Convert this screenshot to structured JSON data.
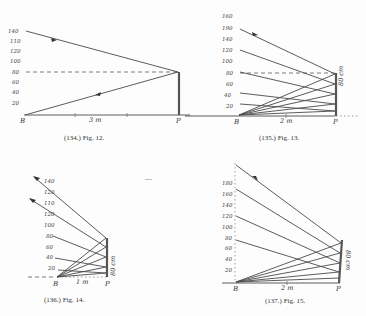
{
  "figures": [
    {
      "id": "fig12",
      "caption": "(134.)  Fig. 12.",
      "scale_labels": [
        "140",
        "110",
        "120",
        "100",
        "80",
        "60",
        "40",
        "20"
      ],
      "point_B": "B",
      "point_P": "P",
      "distance_label": "3 m",
      "mirror_label": ""
    },
    {
      "id": "fig13",
      "caption": "(135.)  Fig. 13.",
      "scale_labels": [
        "160",
        "190",
        "140",
        "120",
        "100",
        "80",
        "60",
        "40",
        "20"
      ],
      "point_B": "B",
      "point_P": "P",
      "distance_label": "2 m",
      "mirror_label": "80 cm"
    },
    {
      "id": "fig14",
      "caption": "(136.)  Fig. 14.",
      "scale_labels": [
        "140",
        "120",
        "110",
        "120",
        "100",
        "80",
        "60",
        "40",
        "20"
      ],
      "point_B": "B",
      "point_P": "P",
      "distance_label": "1 m",
      "mirror_label": "80 cm"
    },
    {
      "id": "fig15",
      "caption": "(137.)  Fig. 15.",
      "scale_labels": [
        "180",
        "160",
        "140",
        "120",
        "100",
        "80",
        "60",
        "40",
        "20"
      ],
      "point_B": "B",
      "point_P": "P",
      "distance_label": "2 m",
      "mirror_label": "80 cm"
    }
  ],
  "stray_mark": "—"
}
